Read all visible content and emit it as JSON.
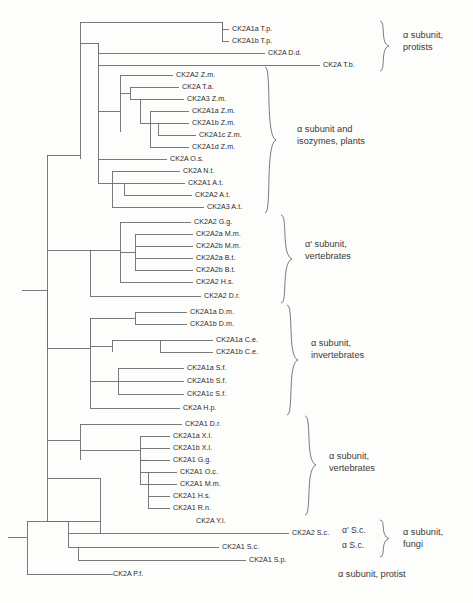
{
  "figure": {
    "type": "phylogenetic-tree",
    "background_color": "#fdfdfc",
    "line_color": "#6b6b6b",
    "text_color": "#2b2b2b"
  },
  "leaves": [
    {
      "id": "l01",
      "label": "CK2A1a T.p.",
      "x": 232,
      "y": 29
    },
    {
      "id": "l02",
      "label": "CK2A1b T.p.",
      "x": 232,
      "y": 41
    },
    {
      "id": "l03",
      "label": "CK2A D.d.",
      "x": 268,
      "y": 53
    },
    {
      "id": "l04",
      "label": "CK2A T.b.",
      "x": 323,
      "y": 65
    },
    {
      "id": "l05",
      "label": "CK2A2 Z.m.",
      "x": 176,
      "y": 75
    },
    {
      "id": "l06",
      "label": "CK2A T.a.",
      "x": 182,
      "y": 87
    },
    {
      "id": "l07",
      "label": "CK2A3 Z.m.",
      "x": 187,
      "y": 99
    },
    {
      "id": "l08",
      "label": "CK2A1a Z.m.",
      "x": 192,
      "y": 111
    },
    {
      "id": "l09",
      "label": "CK2A1b Z.m.",
      "x": 192,
      "y": 123
    },
    {
      "id": "l10",
      "label": "CK2A1c Z.m.",
      "x": 199,
      "y": 135
    },
    {
      "id": "l11",
      "label": "CK2A1d Z.m.",
      "x": 192,
      "y": 147
    },
    {
      "id": "l12",
      "label": "CK2A O.s.",
      "x": 170,
      "y": 159
    },
    {
      "id": "l13",
      "label": "CK2A N.t.",
      "x": 183,
      "y": 171
    },
    {
      "id": "l14",
      "label": "CK2A1 A.t.",
      "x": 188,
      "y": 183
    },
    {
      "id": "l15",
      "label": "CK2A2 A.t.",
      "x": 195,
      "y": 195
    },
    {
      "id": "l16",
      "label": "CK2A3 A.t.",
      "x": 207,
      "y": 207
    },
    {
      "id": "l17",
      "label": "CK2A2 G.g.",
      "x": 194,
      "y": 222
    },
    {
      "id": "l18",
      "label": "CK2A2a M.m.",
      "x": 196,
      "y": 234
    },
    {
      "id": "l19",
      "label": "CK2A2b M.m.",
      "x": 196,
      "y": 246
    },
    {
      "id": "l20",
      "label": "CK2A2a B.t.",
      "x": 196,
      "y": 258
    },
    {
      "id": "l21",
      "label": "CK2A2b B.t.",
      "x": 196,
      "y": 270
    },
    {
      "id": "l22",
      "label": "CK2A2 H.s.",
      "x": 196,
      "y": 282
    },
    {
      "id": "l23",
      "label": "CK2A2 D.r.",
      "x": 204,
      "y": 296
    },
    {
      "id": "l24",
      "label": "CK2A1a D.m.",
      "x": 190,
      "y": 312
    },
    {
      "id": "l25",
      "label": "CK2A1b D.m.",
      "x": 190,
      "y": 324
    },
    {
      "id": "l26",
      "label": "CK2A1a C.e.",
      "x": 216,
      "y": 340
    },
    {
      "id": "l27",
      "label": "CK2A1b C.e.",
      "x": 216,
      "y": 352
    },
    {
      "id": "l28",
      "label": "CK2A1a S.f.",
      "x": 187,
      "y": 368
    },
    {
      "id": "l29",
      "label": "CK2A1b S.f.",
      "x": 187,
      "y": 381
    },
    {
      "id": "l30",
      "label": "CK2A1c S.f.",
      "x": 187,
      "y": 394
    },
    {
      "id": "l31",
      "label": "CK2A H.p.",
      "x": 183,
      "y": 408
    },
    {
      "id": "l32",
      "label": "CK2A1 D.r.",
      "x": 185,
      "y": 424
    },
    {
      "id": "l33",
      "label": "CK2A1a X.l.",
      "x": 173,
      "y": 436
    },
    {
      "id": "l34",
      "label": "CK2A1b X.l.",
      "x": 173,
      "y": 448
    },
    {
      "id": "l35",
      "label": "CK2A1 G.g.",
      "x": 173,
      "y": 460
    },
    {
      "id": "l36",
      "label": "CK2A1 O.c.",
      "x": 180,
      "y": 472
    },
    {
      "id": "l37",
      "label": "CK2A1 M.m.",
      "x": 180,
      "y": 484
    },
    {
      "id": "l38",
      "label": "CK2A1 H.s.",
      "x": 173,
      "y": 496
    },
    {
      "id": "l39",
      "label": "CK2A1 R.n.",
      "x": 173,
      "y": 508
    },
    {
      "id": "l40",
      "label": "CK2A Y.l.",
      "x": 196,
      "y": 521
    },
    {
      "id": "l41",
      "label": "CK2A2 S.c.",
      "x": 292,
      "y": 533
    },
    {
      "id": "l42",
      "label": "CK2A1 S.c.",
      "x": 222,
      "y": 547
    },
    {
      "id": "l43",
      "label": "CK2A1 S.p.",
      "x": 249,
      "y": 560
    },
    {
      "id": "l44",
      "label": "CK2A P.f.",
      "x": 113,
      "y": 574
    }
  ],
  "group_labels": [
    {
      "id": "g1",
      "lines": [
        "α subunit,",
        "protists"
      ],
      "x": 403,
      "y": 37
    },
    {
      "id": "g2",
      "lines": [
        "α subunit and",
        "isozymes, plants"
      ],
      "x": 297,
      "y": 130
    },
    {
      "id": "g3",
      "lines": [
        "α' subunit,",
        "vertebrates"
      ],
      "x": 305,
      "y": 245
    },
    {
      "id": "g4",
      "lines": [
        "α subunit,",
        "invertebrates"
      ],
      "x": 311,
      "y": 344
    },
    {
      "id": "g5",
      "lines": [
        "α subunit,",
        "vertebrates"
      ],
      "x": 329,
      "y": 457
    },
    {
      "id": "g6",
      "lines": [
        "α subunit,",
        "fungi"
      ],
      "x": 403,
      "y": 533
    },
    {
      "id": "g7",
      "lines": [
        "α subunit, protist"
      ],
      "x": 338,
      "y": 574
    }
  ],
  "sc_labels": [
    {
      "id": "sc1",
      "label": "α' S.c.",
      "x": 342,
      "y": 530
    },
    {
      "id": "sc2",
      "label": "α S.c.",
      "x": 342,
      "y": 545
    }
  ],
  "braces": [
    {
      "id": "b1",
      "x": 381,
      "top": 22,
      "bottom": 70,
      "for": "protists"
    },
    {
      "id": "b2",
      "x": 268,
      "top": 68,
      "bottom": 212,
      "for": "plants"
    },
    {
      "id": "b3",
      "x": 283,
      "top": 216,
      "bottom": 302,
      "for": "alpha-prime-vertebrates"
    },
    {
      "id": "b4",
      "x": 289,
      "top": 306,
      "bottom": 414,
      "for": "invertebrates"
    },
    {
      "id": "b5",
      "x": 307,
      "top": 417,
      "bottom": 514,
      "for": "vertebrates"
    },
    {
      "id": "b6",
      "x": 381,
      "top": 521,
      "bottom": 556,
      "for": "fungi"
    }
  ]
}
